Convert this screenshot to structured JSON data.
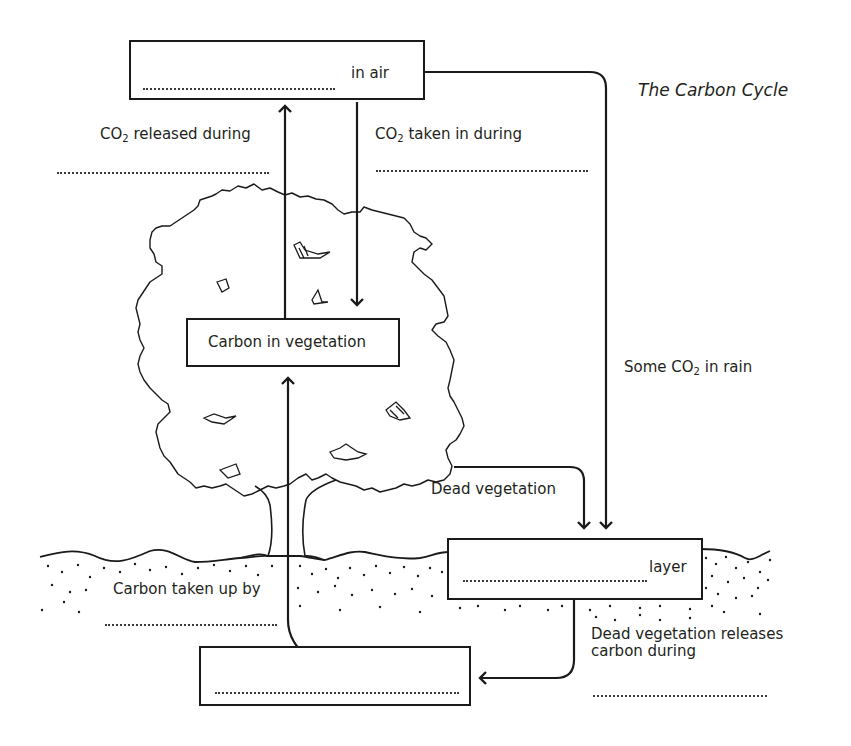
{
  "title": "The Carbon Cycle",
  "boxes": {
    "air": {
      "suffix": "in air",
      "blank": ""
    },
    "vegetation": {
      "label": "Carbon in vegetation"
    },
    "layer": {
      "suffix": "layer",
      "blank": ""
    },
    "bottom": {
      "blank": ""
    }
  },
  "labels": {
    "co2_released": {
      "pre": "CO",
      "sub": "2",
      "post": " released during",
      "blank": ""
    },
    "co2_taken_in": {
      "pre": "CO",
      "sub": "2",
      "post": " taken in during",
      "blank": ""
    },
    "co2_rain": {
      "pre": "Some CO",
      "sub": "2",
      "post": " in rain"
    },
    "dead_vegetation": "Dead vegetation",
    "carbon_taken_up": {
      "text": "Carbon taken up by",
      "blank": ""
    },
    "dead_releases": {
      "line1": "Dead vegetation releases",
      "line2": "carbon during",
      "blank": ""
    }
  },
  "colors": {
    "ink": "#1a1a1a",
    "text": "#231f20",
    "background": "#ffffff"
  }
}
